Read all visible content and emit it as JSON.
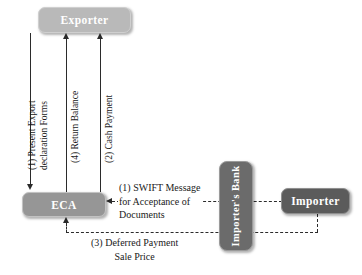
{
  "diagram": {
    "colors": {
      "exporter_fill": "#b9b9b9",
      "eca_fill": "#969696",
      "importer_bank_fill": "#6b6b6b",
      "importer_fill": "#5b5b5b",
      "line": "#2b2b2b",
      "text": "#1a1a1a"
    },
    "nodes": {
      "exporter": "Exporter",
      "eca": "ECA",
      "importer_bank_line1": "Importer's",
      "importer_bank_line2": "Bank",
      "importer": "Importer"
    },
    "flows": {
      "present_export_line1": "(1) Present Export",
      "present_export_line2": "declaration Forms",
      "return_balance": "(4) Return Balance",
      "cash_payment": "(2) Cash Payment",
      "swift_line1": "(1) SWIFT Message",
      "swift_line2": "for Acceptance of",
      "swift_line3": "Documents",
      "deferred_line1": "(3) Deferred Payment",
      "deferred_line2": "Sale Price"
    }
  }
}
